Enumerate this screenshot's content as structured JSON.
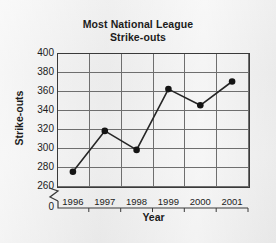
{
  "chart_data": {
    "type": "line",
    "title": "Most National League Strike-outs",
    "title_lines": [
      "Most National League",
      "Strike-outs"
    ],
    "xlabel": "Year",
    "ylabel": "Strike-outs",
    "categories": [
      "1996",
      "1997",
      "1998",
      "1999",
      "2000",
      "2001"
    ],
    "values": [
      275,
      318,
      298,
      362,
      345,
      370
    ],
    "series": [
      {
        "name": "Strike-outs",
        "values": [
          275,
          318,
          298,
          362,
          345,
          370
        ]
      }
    ],
    "points": [
      {
        "x": "1996",
        "y": 275
      },
      {
        "x": "1997",
        "y": 318
      },
      {
        "x": "1998",
        "y": 298
      },
      {
        "x": "1999",
        "y": 362
      },
      {
        "x": "2000",
        "y": 345
      },
      {
        "x": "2001",
        "y": 370
      }
    ],
    "ylim": [
      260,
      400
    ],
    "yticks": [
      260,
      280,
      300,
      320,
      340,
      360,
      380,
      400
    ],
    "ytick_labels": [
      "260",
      "280",
      "300",
      "320",
      "340",
      "360",
      "380",
      "400"
    ],
    "y_origin_label": "0",
    "y_axis_break": true,
    "grid": true,
    "legend": null,
    "legend_position": "none",
    "marker": "filled-circle",
    "line_color": "#262626",
    "marker_color": "#141414",
    "grid_color": "#6e6e6e",
    "background_color": "#eeeeee"
  }
}
